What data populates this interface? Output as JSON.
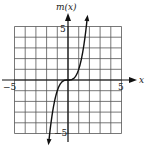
{
  "chart_data": {
    "type": "line",
    "title": "",
    "xlabel": "x",
    "ylabel": "m(x)",
    "xlim": [
      -5,
      5
    ],
    "ylim": [
      -5,
      5
    ],
    "grid": true,
    "x_ticks_labeled": [
      "-5",
      "5"
    ],
    "y_ticks_labeled": [
      "5",
      "-5"
    ],
    "series": [
      {
        "name": "m(x)",
        "x": [
          -1.8,
          -1.5,
          -1.0,
          -0.5,
          0,
          0.5,
          1.0,
          1.5,
          1.8
        ],
        "y": [
          -5.8,
          -3.4,
          -1.0,
          -0.1,
          0,
          0.1,
          1.0,
          3.4,
          5.8
        ]
      }
    ]
  },
  "labels": {
    "y_axis": "m(x)",
    "x_axis": "x",
    "x_min": "−5",
    "x_max": "5",
    "y_max": "5",
    "y_min": "−5"
  }
}
